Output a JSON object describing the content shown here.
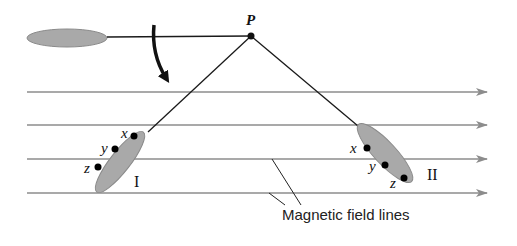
{
  "diagram": {
    "pivot_label": "P",
    "coil_I": {
      "label": "I",
      "points": [
        "x",
        "y",
        "z"
      ]
    },
    "coil_II": {
      "label": "II",
      "points": [
        "x",
        "y",
        "z"
      ]
    },
    "field_lines_label": "Magnetic field lines",
    "field_line_count": 4,
    "colors": {
      "coil_fill": "#a9a9a9",
      "coil_stroke": "#8a8a8a",
      "field_line": "#8c8c8c",
      "string": "#1a1a1a",
      "point": "#000000"
    }
  }
}
